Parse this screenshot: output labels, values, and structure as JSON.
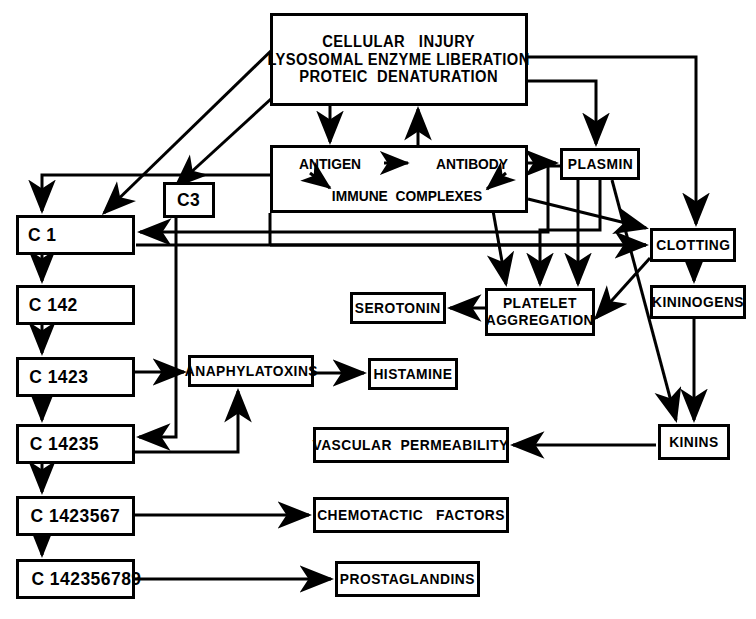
{
  "diagram": {
    "type": "flowchart",
    "line_color": "#000000",
    "background": "#ffffff",
    "nodes": [
      {
        "id": "cellular_injury",
        "label": "CELLULAR   INJURY\nLYSOSOMAL ENZYME LIBERATION\nPROTEIC  DENATURATION",
        "x": 270,
        "y": 13,
        "w": 258,
        "h": 93,
        "fontSize": 16,
        "align": "center"
      },
      {
        "id": "immune_box",
        "label": "",
        "x": 270,
        "y": 145,
        "w": 258,
        "h": 68,
        "fontSize": 15,
        "align": "center"
      },
      {
        "id": "antigen",
        "label": "ANTIGEN",
        "x": 287,
        "y": 152,
        "w": 86,
        "h": 22,
        "fontSize": 15,
        "align": "center"
      },
      {
        "id": "antibody",
        "label": "ANTIBODY",
        "x": 424,
        "y": 152,
        "w": 96,
        "h": 22,
        "fontSize": 15,
        "align": "center"
      },
      {
        "id": "immune_complexes",
        "label": "IMMUNE  COMPLEXES",
        "x": 322,
        "y": 185,
        "w": 170,
        "h": 20,
        "fontSize": 15,
        "align": "center"
      },
      {
        "id": "c3",
        "label": "C3",
        "x": 163,
        "y": 182,
        "w": 52,
        "h": 36,
        "fontSize": 19,
        "align": "center"
      },
      {
        "id": "plasmin",
        "label": "PLASMIN",
        "x": 560,
        "y": 148,
        "w": 80,
        "h": 32,
        "fontSize": 15,
        "align": "center"
      },
      {
        "id": "clotting",
        "label": "CLOTTING",
        "x": 650,
        "y": 228,
        "w": 86,
        "h": 34,
        "fontSize": 15,
        "align": "center"
      },
      {
        "id": "kininogens",
        "label": "KININOGENS",
        "x": 650,
        "y": 285,
        "w": 96,
        "h": 34,
        "fontSize": 15,
        "align": "center"
      },
      {
        "id": "kinins",
        "label": "KININS",
        "x": 658,
        "y": 424,
        "w": 72,
        "h": 36,
        "fontSize": 15,
        "align": "center"
      },
      {
        "id": "platelet_aggregation",
        "label": "PLATELET\nAGGREGATION",
        "x": 485,
        "y": 288,
        "w": 110,
        "h": 48,
        "fontSize": 15,
        "align": "center"
      },
      {
        "id": "serotonin",
        "label": "SEROTONIN",
        "x": 350,
        "y": 292,
        "w": 96,
        "h": 32,
        "fontSize": 15,
        "align": "center"
      },
      {
        "id": "anaphylatoxins",
        "label": "ANAPHYLATOXINS",
        "x": 188,
        "y": 355,
        "w": 126,
        "h": 32,
        "fontSize": 15,
        "align": "center"
      },
      {
        "id": "histamine",
        "label": "HISTAMINE",
        "x": 368,
        "y": 358,
        "w": 90,
        "h": 32,
        "fontSize": 15,
        "align": "center"
      },
      {
        "id": "vascular_permeability",
        "label": "VASCULAR  PERMEABILITY",
        "x": 313,
        "y": 427,
        "w": 196,
        "h": 36,
        "fontSize": 15,
        "align": "center"
      },
      {
        "id": "chemotactic_factors",
        "label": "CHEMOTACTIC   FACTORS",
        "x": 313,
        "y": 497,
        "w": 196,
        "h": 36,
        "fontSize": 15,
        "align": "center"
      },
      {
        "id": "prostaglandins",
        "label": "PROSTAGLANDINS",
        "x": 335,
        "y": 561,
        "w": 145,
        "h": 36,
        "fontSize": 15,
        "align": "center"
      },
      {
        "id": "c1",
        "label": "C 1",
        "x": 16,
        "y": 215,
        "w": 119,
        "h": 40,
        "fontSize": 19,
        "align": "left"
      },
      {
        "id": "c142",
        "label": "C 142",
        "x": 16,
        "y": 285,
        "w": 119,
        "h": 40,
        "fontSize": 19,
        "align": "left"
      },
      {
        "id": "c1423",
        "label": "C 1423",
        "x": 16,
        "y": 357,
        "w": 119,
        "h": 40,
        "fontSize": 19,
        "align": "left"
      },
      {
        "id": "c14235",
        "label": "C 14235",
        "x": 16,
        "y": 424,
        "w": 119,
        "h": 40,
        "fontSize": 19,
        "align": "left"
      },
      {
        "id": "c1423567",
        "label": "C 1423567",
        "x": 16,
        "y": 496,
        "w": 119,
        "h": 40,
        "fontSize": 19,
        "align": "left"
      },
      {
        "id": "c142356789",
        "label": "C 142356789",
        "x": 16,
        "y": 559,
        "w": 119,
        "h": 40,
        "fontSize": 19,
        "align": "left"
      }
    ],
    "inline_arrows": [
      {
        "id": "antigen-to-antibody",
        "from": "antigen",
        "to": "antibody"
      },
      {
        "id": "antigen-to-immune-complexes",
        "from": "antigen",
        "to": "immune_complexes"
      },
      {
        "id": "antibody-to-immune-complexes",
        "from": "antibody",
        "to": "immune_complexes"
      }
    ],
    "edges": [
      {
        "id": "cellular-injury-to-immune-box",
        "from": "cellular_injury",
        "to": "immune_box"
      },
      {
        "id": "immune-box-to-cellular-injury",
        "from": "immune_box",
        "to": "cellular_injury"
      },
      {
        "id": "cellular-injury-to-c1",
        "from": "cellular_injury",
        "to": "c1"
      },
      {
        "id": "cellular-injury-to-c3",
        "from": "cellular_injury",
        "to": "c3"
      },
      {
        "id": "cellular-injury-to-plasmin",
        "from": "cellular_injury",
        "to": "plasmin"
      },
      {
        "id": "cellular-injury-to-clotting",
        "from": "cellular_injury",
        "to": "clotting"
      },
      {
        "id": "immune-box-to-c1",
        "from": "immune_box",
        "to": "c1"
      },
      {
        "id": "immune-box-to-plasmin",
        "from": "immune_box",
        "to": "plasmin"
      },
      {
        "id": "immune-box-to-clotting",
        "from": "immune_box",
        "to": "clotting"
      },
      {
        "id": "immune-box-to-platelet-aggregation",
        "from": "immune_box",
        "to": "platelet_aggregation"
      },
      {
        "id": "c3-to-c14235",
        "from": "c3",
        "to": "c14235"
      },
      {
        "id": "c1-to-c142",
        "from": "c1",
        "to": "c142"
      },
      {
        "id": "c142-to-c1423",
        "from": "c142",
        "to": "c1423"
      },
      {
        "id": "c1423-to-c14235",
        "from": "c1423",
        "to": "c14235"
      },
      {
        "id": "c14235-to-c1423567",
        "from": "c14235",
        "to": "c1423567"
      },
      {
        "id": "c1423567-to-c142356789",
        "from": "c1423567",
        "to": "c142356789"
      },
      {
        "id": "c1423-to-anaphylatoxins",
        "from": "c1423",
        "to": "anaphylatoxins"
      },
      {
        "id": "c14235-to-anaphylatoxins",
        "from": "c14235",
        "to": "anaphylatoxins"
      },
      {
        "id": "anaphylatoxins-to-histamine",
        "from": "anaphylatoxins",
        "to": "histamine"
      },
      {
        "id": "c1423567-to-chemotactic-factors",
        "from": "c1423567",
        "to": "chemotactic_factors"
      },
      {
        "id": "c142356789-to-prostaglandins",
        "from": "c142356789",
        "to": "prostaglandins"
      },
      {
        "id": "plasmin-to-platelet-aggregation",
        "from": "plasmin",
        "to": "platelet_aggregation"
      },
      {
        "id": "plasmin-to-clotting",
        "from": "plasmin",
        "to": "clotting"
      },
      {
        "id": "plasmin-to-c1",
        "from": "plasmin",
        "to": "c1"
      },
      {
        "id": "plasmin-to-kinins",
        "from": "plasmin",
        "to": "kinins"
      },
      {
        "id": "clotting-to-kininogens",
        "from": "clotting",
        "to": "kininogens"
      },
      {
        "id": "clotting-to-platelet-aggregation",
        "from": "clotting",
        "to": "platelet_aggregation"
      },
      {
        "id": "kininogens-to-kinins",
        "from": "kininogens",
        "to": "kinins"
      },
      {
        "id": "kinins-to-vascular-permeability",
        "from": "kinins",
        "to": "vascular_permeability"
      },
      {
        "id": "platelet-aggregation-to-serotonin",
        "from": "platelet_aggregation",
        "to": "serotonin"
      }
    ]
  }
}
